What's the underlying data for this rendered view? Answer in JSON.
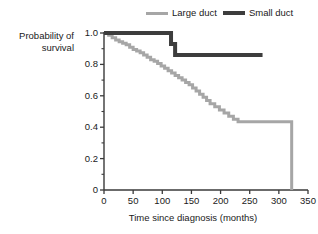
{
  "legend": {
    "position": "top-right",
    "items": [
      {
        "label": "Large duct",
        "color": "#a6a6a6",
        "icon": "line-swatch-icon",
        "width": 3
      },
      {
        "label": "Small duct",
        "color": "#3d3d3d",
        "icon": "line-swatch-icon",
        "width": 4
      }
    ]
  },
  "chart_data": {
    "type": "line",
    "title": "",
    "subtitle": "",
    "xlabel": "Time since diagnosis (months)",
    "ylabel": "Probability of survival",
    "xlim": [
      0,
      350
    ],
    "ylim": [
      0,
      1.0
    ],
    "xticks": [
      0,
      50,
      100,
      150,
      200,
      250,
      300,
      350
    ],
    "xtick_labels": [
      "0",
      "50",
      "100",
      "150",
      "200",
      "250",
      "300",
      "350"
    ],
    "yticks": [
      0,
      0.2,
      0.4,
      0.6,
      0.8,
      1.0
    ],
    "ytick_labels": [
      "0",
      "0.2",
      "0.4",
      "0.6",
      "0.8",
      "1.0"
    ],
    "minor_ticks": true,
    "grid": false,
    "legend_position": "top-right",
    "step_style": "post",
    "series": [
      {
        "name": "Large duct",
        "color": "#a6a6a6",
        "line_width": 3,
        "x": [
          0,
          8,
          14,
          20,
          26,
          32,
          38,
          44,
          50,
          56,
          62,
          68,
          74,
          80,
          86,
          92,
          98,
          104,
          110,
          116,
          122,
          128,
          134,
          140,
          146,
          152,
          158,
          164,
          170,
          176,
          182,
          190,
          198,
          206,
          214,
          222,
          230,
          322,
          322
        ],
        "y": [
          1.0,
          0.985,
          0.97,
          0.955,
          0.945,
          0.935,
          0.925,
          0.91,
          0.895,
          0.885,
          0.875,
          0.86,
          0.845,
          0.83,
          0.82,
          0.805,
          0.79,
          0.775,
          0.76,
          0.745,
          0.73,
          0.715,
          0.7,
          0.685,
          0.67,
          0.65,
          0.63,
          0.61,
          0.59,
          0.57,
          0.55,
          0.53,
          0.51,
          0.49,
          0.47,
          0.45,
          0.435,
          0.435,
          0.0
        ]
      },
      {
        "name": "Small duct",
        "color": "#3d3d3d",
        "line_width": 4,
        "x": [
          0,
          115,
          115,
          122,
          122,
          272
        ],
        "y": [
          1.0,
          1.0,
          0.93,
          0.93,
          0.86,
          0.86
        ]
      }
    ],
    "annotations": []
  },
  "axes": {
    "y_title_line1": "Probability of",
    "y_title_line2": "survival",
    "x_title": "Time since diagnosis (months)"
  }
}
